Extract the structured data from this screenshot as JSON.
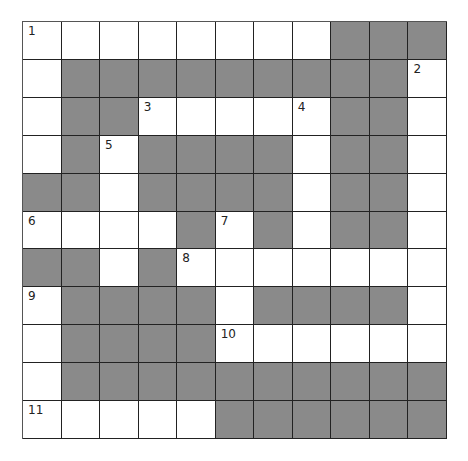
{
  "crossword": {
    "rows": 11,
    "cols": 11,
    "colors": {
      "block": "#8a8a8a",
      "open": "#ffffff",
      "line": "#222222"
    },
    "layout": [
      "........###",
      ".#########.",
      ".##.....##.",
      ".#.####.##.",
      "##.####.##.",
      "....#.#.##.",
      "##.#.......",
      ".####.####.",
      ".####......",
      ".##########",
      ".....######"
    ],
    "numbers": [
      {
        "n": "1",
        "r": 0,
        "c": 0
      },
      {
        "n": "2",
        "r": 1,
        "c": 10
      },
      {
        "n": "3",
        "r": 2,
        "c": 3
      },
      {
        "n": "4",
        "r": 2,
        "c": 7
      },
      {
        "n": "5",
        "r": 3,
        "c": 2
      },
      {
        "n": "6",
        "r": 5,
        "c": 0
      },
      {
        "n": "7",
        "r": 5,
        "c": 5
      },
      {
        "n": "8",
        "r": 6,
        "c": 4
      },
      {
        "n": "9",
        "r": 7,
        "c": 0
      },
      {
        "n": "10",
        "r": 8,
        "c": 5
      },
      {
        "n": "11",
        "r": 10,
        "c": 0
      }
    ]
  }
}
